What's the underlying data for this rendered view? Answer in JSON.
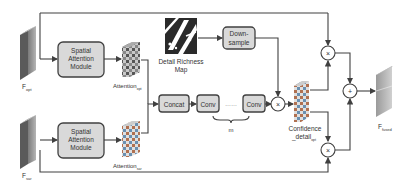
{
  "diagram": {
    "inputs": {
      "top": {
        "label": "F",
        "sub": "opt",
        "sup": "i"
      },
      "bottom": {
        "label": "F",
        "sub": "sar",
        "sup": "i"
      }
    },
    "modules": {
      "sam_top": {
        "line1": "Spatial",
        "line2": "Attention",
        "line3": "Module"
      },
      "sam_bottom": {
        "line1": "Spatial",
        "line2": "Attention",
        "line3": "Module"
      },
      "concat": "Concat",
      "conv1": "Conv",
      "conv2": "Conv",
      "dots": "……",
      "downsample": {
        "line1": "Down-",
        "line2": "sample"
      },
      "m_label": "m"
    },
    "attention_top": {
      "label": "Attention",
      "sub": "opt"
    },
    "attention_bottom": {
      "label": "Attention",
      "sub": "sar"
    },
    "detail_map": {
      "line1": "Detail Richness",
      "line2": "Map"
    },
    "confidence": {
      "line1": "Confidence",
      "line2": "_detail",
      "sub": "opt"
    },
    "output": {
      "label": "F",
      "sub": "fused",
      "sup": "i"
    },
    "operators": {
      "multiply": "×",
      "add": "+"
    },
    "colors": {
      "box_fill": "#d9d9d9",
      "line": "#404040",
      "text": "#333333"
    }
  }
}
